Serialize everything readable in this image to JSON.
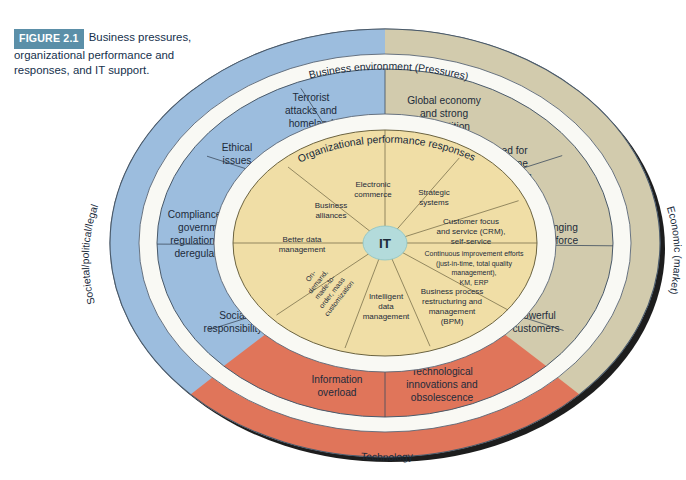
{
  "figure": {
    "tag": "FIGURE 2.1",
    "caption": "Business pressures, organizational performance and responses, and IT support."
  },
  "colors": {
    "blue": "#9cbdde",
    "tan": "#d2cbad",
    "orange": "#e0755a",
    "yellow": "#f0dea6",
    "center": "#b3dbdb",
    "white_band": "#f7f7f2",
    "stroke": "#4a5a6a",
    "caption_accent": "#5b8fa8",
    "caption_text": "#14304c"
  },
  "bands": {
    "outer_top": "Business environment (Pressures)",
    "outer_left": "Societal/political/legal",
    "outer_right": "Economic (market)",
    "outer_bottom": "Technology",
    "inner_band": "Organizational performance responses"
  },
  "center": {
    "label": "IT"
  },
  "pressures_ring": [
    {
      "label": "Terrorist attacks and homeland security",
      "group": "societal",
      "color": "#9cbdde"
    },
    {
      "label": "Ethical issues",
      "group": "societal",
      "color": "#9cbdde"
    },
    {
      "label": "Compliance with government regulations and deregulations",
      "group": "societal",
      "color": "#9cbdde"
    },
    {
      "label": "Social responsibility",
      "group": "societal",
      "color": "#9cbdde"
    },
    {
      "label": "Information overload",
      "group": "technology",
      "color": "#e0755a"
    },
    {
      "label": "Technological innovations and obsolescence",
      "group": "technology",
      "color": "#e0755a"
    },
    {
      "label": "Powerful customers",
      "group": "economic",
      "color": "#d2cbad"
    },
    {
      "label": "Changing workforce",
      "group": "economic",
      "color": "#d2cbad"
    },
    {
      "label": "Need for real-time operations",
      "group": "economic",
      "color": "#d2cbad"
    },
    {
      "label": "Global economy and strong competition",
      "group": "economic",
      "color": "#d2cbad"
    }
  ],
  "responses_ring": [
    {
      "label": "Electronic commerce"
    },
    {
      "label": "Strategic systems"
    },
    {
      "label": "Customer focus and service (CRM), self-service"
    },
    {
      "label": "Continuous improvement efforts (just-in-time, total quality management), KM, ERP"
    },
    {
      "label": "Business process restructuring and management (BPM)"
    },
    {
      "label": "Intelligent data management"
    },
    {
      "label": "On-demand, made-to-order, mass customization"
    },
    {
      "label": "Better data management"
    },
    {
      "label": "Business alliances"
    }
  ]
}
